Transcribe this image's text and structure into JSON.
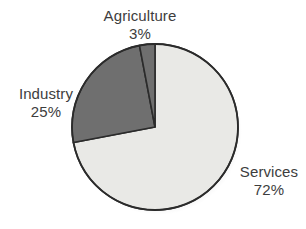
{
  "chart_data": {
    "type": "pie",
    "title": "",
    "categories": [
      "Services",
      "Industry",
      "Agriculture"
    ],
    "values": [
      72,
      25,
      3
    ],
    "unit": "%",
    "legend_position": "outside-labels",
    "grid": false,
    "slices": [
      {
        "name": "Services",
        "value": 72,
        "value_label": "72%",
        "color": "#e9e9e6",
        "start_angle_deg": 0,
        "end_angle_deg": 259.2
      },
      {
        "name": "Industry",
        "value": 25,
        "value_label": "25%",
        "color": "#6f6f6f",
        "start_angle_deg": 259.2,
        "end_angle_deg": 349.2
      },
      {
        "name": "Agriculture",
        "value": 3,
        "value_label": "3%",
        "color": "#6f6f6f",
        "start_angle_deg": 349.2,
        "end_angle_deg": 360
      }
    ]
  },
  "labels": {
    "agriculture": {
      "name": "Agriculture",
      "value": "3%"
    },
    "industry": {
      "name": "Industry",
      "value": "25%"
    },
    "services": {
      "name": "Services",
      "value": "72%"
    }
  },
  "style": {
    "background": "#ffffff",
    "outline": "#2b2b2b",
    "text_color": "#3d3d3d",
    "slice_light": "#e9e9e6",
    "slice_dark": "#6f6f6f"
  }
}
